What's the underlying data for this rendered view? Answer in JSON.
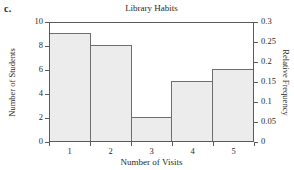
{
  "part_label": "c.",
  "chart_data": {
    "type": "bar",
    "title": "Library Habits",
    "xlabel": "Number of Visits",
    "ylabel": "Number of Students",
    "y2label": "Relative Frequency",
    "categories": [
      "1",
      "2",
      "3",
      "4",
      "5"
    ],
    "values": [
      9,
      8,
      2,
      5,
      6
    ],
    "series": [
      {
        "name": "Number of Students",
        "values": [
          9,
          8,
          2,
          5,
          6
        ]
      },
      {
        "name": "Relative Frequency",
        "values": [
          0.3,
          0.2667,
          0.0667,
          0.1667,
          0.2
        ]
      }
    ],
    "ylim": [
      0,
      10
    ],
    "yticks": [
      0,
      2,
      4,
      6,
      8,
      10
    ],
    "ytick_labels": [
      "0",
      "2",
      "4",
      "6",
      "8",
      "10"
    ],
    "y2lim": [
      0,
      0.3
    ],
    "y2ticks": [
      0,
      0.05,
      0.1,
      0.15,
      0.2,
      0.25,
      0.3
    ],
    "y2tick_labels": [
      "0",
      "0.05",
      "0.1",
      "0.15",
      "0.2",
      "0.25",
      "0.3"
    ],
    "xlim": [
      0.5,
      5.5
    ],
    "xticks": [
      0.5,
      1.5,
      2.5,
      3.5,
      4.5,
      5.5
    ],
    "grid": false,
    "legend": "none",
    "bar_fill": "#ececec",
    "bar_edge": "#6e6e6e",
    "axis_color": "#5a5a5a",
    "background": "#ffffff",
    "total_students": 30
  }
}
